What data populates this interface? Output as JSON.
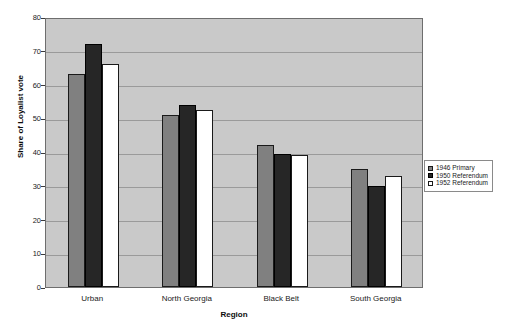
{
  "chart_data": {
    "type": "bar",
    "title": "",
    "subtitle": "",
    "xlabel": "Region",
    "ylabel": "Share of Loyalist vote",
    "categories": [
      "Urban",
      "North Georgia",
      "Black Belt",
      "South Georgia"
    ],
    "series": [
      {
        "name": "1946 Primary",
        "color": "#808080",
        "border": "#1a1a1a",
        "values": [
          63,
          51,
          42,
          35
        ]
      },
      {
        "name": "1950 Referendum",
        "color": "#262626",
        "border": "#000000",
        "values": [
          72,
          54,
          39.5,
          30
        ]
      },
      {
        "name": "1952 Referendum",
        "color": "#ffffff",
        "border": "#1a1a1a",
        "values": [
          66,
          52.5,
          39,
          33
        ]
      }
    ],
    "ylim": [
      0,
      80
    ],
    "ytick_step": 10,
    "yticks": [
      "80",
      "70",
      "60",
      "50",
      "40",
      "30",
      "20",
      "10",
      "0"
    ],
    "grid": true,
    "grid_axis": "y",
    "legend_position": "right",
    "plot_background": "#c9c9c9",
    "figure_background": "#ffffff"
  }
}
